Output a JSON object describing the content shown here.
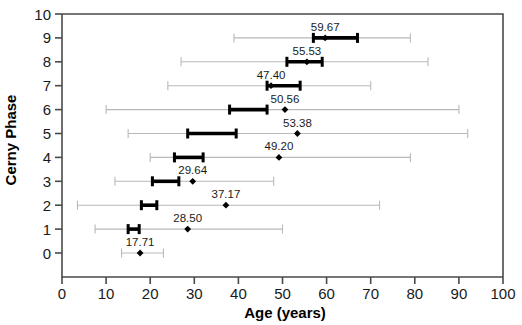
{
  "chart_data": {
    "type": "scatter",
    "title": "",
    "xlabel": "Age (years)",
    "ylabel": "Cerny Phase",
    "xlim": [
      0,
      100
    ],
    "ylim": [
      0,
      10
    ],
    "xticks": [
      0,
      10,
      20,
      30,
      40,
      50,
      60,
      70,
      80,
      90,
      100
    ],
    "yticks": [
      0,
      1,
      2,
      3,
      4,
      5,
      6,
      7,
      8,
      9,
      10
    ],
    "grid": false,
    "legend": null,
    "colors": {
      "marker": "#000000",
      "box": "#000000",
      "whisker": "#b9b9b9"
    },
    "series": [
      {
        "name": "Cerny Phase 9",
        "phase": 9,
        "mean_label": "59.67",
        "mean": 59.67,
        "marker": 59.67,
        "box": [
          57.0,
          67.0
        ],
        "whisker": [
          39.0,
          79.0
        ],
        "label_pos": "above"
      },
      {
        "name": "Cerny Phase 8",
        "phase": 8,
        "mean_label": "55.53",
        "mean": 55.53,
        "marker": 55.53,
        "box": [
          51.0,
          59.0
        ],
        "whisker": [
          27.0,
          83.0
        ],
        "label_pos": "above"
      },
      {
        "name": "Cerny Phase 7",
        "phase": 7,
        "mean_label": "47.40",
        "mean": 47.4,
        "marker": 47.4,
        "box": [
          46.5,
          54.0
        ],
        "whisker": [
          24.0,
          70.0
        ],
        "label_pos": "above"
      },
      {
        "name": "Cerny Phase 6",
        "phase": 6,
        "mean_label": "50.56",
        "mean": 50.56,
        "marker": 50.56,
        "box": [
          38.0,
          46.5
        ],
        "whisker": [
          10.0,
          90.0
        ],
        "label_pos": "above"
      },
      {
        "name": "Cerny Phase 5",
        "phase": 5,
        "mean_label": "53.38",
        "mean": 53.38,
        "marker": 53.38,
        "box": [
          28.5,
          39.5
        ],
        "whisker": [
          15.0,
          92.0
        ],
        "label_pos": "above"
      },
      {
        "name": "Cerny Phase 4",
        "phase": 4,
        "mean_label": "49.20",
        "mean": 49.2,
        "marker": 49.2,
        "box": [
          25.5,
          32.0
        ],
        "whisker": [
          20.0,
          79.0
        ],
        "label_pos": "above"
      },
      {
        "name": "Cerny Phase 3",
        "phase": 3,
        "mean_label": "29.64",
        "mean": 29.64,
        "marker": 29.64,
        "box": [
          20.5,
          26.5
        ],
        "whisker": [
          12.0,
          48.0
        ],
        "label_pos": "above"
      },
      {
        "name": "Cerny Phase 2",
        "phase": 2,
        "mean_label": "37.17",
        "mean": 37.17,
        "marker": 37.17,
        "box": [
          18.0,
          21.5
        ],
        "whisker": [
          3.5,
          72.0
        ],
        "label_pos": "above"
      },
      {
        "name": "Cerny Phase 1",
        "phase": 1,
        "mean_label": "28.50",
        "mean": 28.5,
        "marker": 28.5,
        "box": [
          15.0,
          17.5
        ],
        "whisker": [
          7.5,
          50.0
        ],
        "label_pos": "above"
      },
      {
        "name": "Cerny Phase 0",
        "phase": 0,
        "mean_label": "17.71",
        "mean": 17.71,
        "marker": 17.71,
        "box": null,
        "whisker": [
          13.5,
          23.0
        ],
        "label_pos": "above"
      }
    ]
  },
  "axes": {
    "x_title": "Age (years)",
    "y_title": "Cerny Phase",
    "x_tick_labels": [
      "0",
      "10",
      "20",
      "30",
      "40",
      "50",
      "60",
      "70",
      "80",
      "90",
      "100"
    ],
    "y_tick_labels": [
      "0",
      "1",
      "2",
      "3",
      "4",
      "5",
      "6",
      "7",
      "8",
      "9",
      "10"
    ]
  }
}
